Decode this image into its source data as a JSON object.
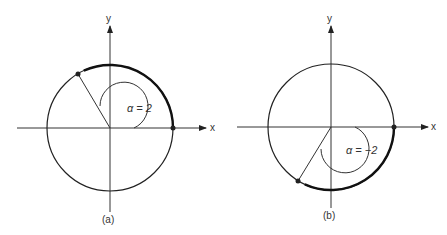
{
  "figures": [
    {
      "id": "a",
      "caption": "(a)",
      "angle_label": "α = 2",
      "x_axis_label": "x",
      "y_axis_label": "y"
    },
    {
      "id": "b",
      "caption": "(b)",
      "angle_label": "α = −2",
      "x_axis_label": "x",
      "y_axis_label": "y"
    }
  ],
  "colors": {
    "stroke": "#222222",
    "background": "#ffffff"
  }
}
